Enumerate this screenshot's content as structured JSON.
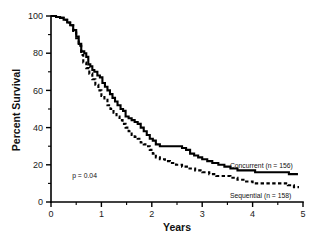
{
  "chart_data": {
    "type": "line",
    "title": "",
    "subtitle": "",
    "xlabel": "Years",
    "ylabel": "Percent Survival",
    "xlim": [
      0,
      5
    ],
    "ylim": [
      0,
      100
    ],
    "xticks": [
      0,
      1,
      2,
      3,
      4,
      5
    ],
    "xtick_labels": [
      "0",
      "1",
      "2",
      "3",
      "4",
      "5"
    ],
    "xminor_ticks": [
      0.5,
      1.5,
      2.5,
      3.5,
      4.5
    ],
    "yticks": [
      0,
      20,
      40,
      60,
      80,
      100
    ],
    "ytick_labels": [
      "0",
      "20",
      "40",
      "60",
      "80",
      "100"
    ],
    "yminor_ticks": [
      10,
      30,
      50,
      70,
      90
    ],
    "grid": false,
    "legend_position": "inline-right",
    "annotations": [
      {
        "name": "p-value",
        "text": "p = 0.04",
        "x": 0.42,
        "y": 13
      }
    ],
    "series": [
      {
        "name": "Concurrent",
        "label": "Concurrent (n = 156)",
        "n": 156,
        "style": "solid",
        "color": "#000000",
        "label_x": 3.55,
        "label_y": 20,
        "points": [
          [
            0.0,
            100
          ],
          [
            0.1,
            99.5
          ],
          [
            0.18,
            99
          ],
          [
            0.25,
            98
          ],
          [
            0.32,
            96.5
          ],
          [
            0.38,
            95
          ],
          [
            0.44,
            92.5
          ],
          [
            0.5,
            89
          ],
          [
            0.55,
            85
          ],
          [
            0.6,
            81
          ],
          [
            0.66,
            80
          ],
          [
            0.7,
            78
          ],
          [
            0.74,
            74
          ],
          [
            0.78,
            73
          ],
          [
            0.82,
            71
          ],
          [
            0.86,
            70
          ],
          [
            0.92,
            68
          ],
          [
            0.97,
            67
          ],
          [
            1.02,
            64
          ],
          [
            1.07,
            62
          ],
          [
            1.12,
            60
          ],
          [
            1.17,
            58
          ],
          [
            1.22,
            56
          ],
          [
            1.27,
            54
          ],
          [
            1.32,
            52
          ],
          [
            1.38,
            50
          ],
          [
            1.43,
            49
          ],
          [
            1.48,
            46
          ],
          [
            1.54,
            45
          ],
          [
            1.6,
            44
          ],
          [
            1.66,
            43
          ],
          [
            1.72,
            42
          ],
          [
            1.78,
            40
          ],
          [
            1.84,
            38
          ],
          [
            1.9,
            36
          ],
          [
            1.96,
            34
          ],
          [
            2.02,
            33
          ],
          [
            2.08,
            31
          ],
          [
            2.16,
            30
          ],
          [
            2.26,
            30
          ],
          [
            2.38,
            30
          ],
          [
            2.5,
            30
          ],
          [
            2.6,
            29
          ],
          [
            2.68,
            28
          ],
          [
            2.76,
            26
          ],
          [
            2.84,
            25
          ],
          [
            2.92,
            24
          ],
          [
            3.0,
            23
          ],
          [
            3.1,
            22
          ],
          [
            3.2,
            21
          ],
          [
            3.32,
            20
          ],
          [
            3.44,
            19
          ],
          [
            3.56,
            18
          ],
          [
            3.7,
            17
          ],
          [
            3.86,
            17
          ],
          [
            4.05,
            16
          ],
          [
            4.3,
            16
          ],
          [
            4.55,
            16
          ],
          [
            4.72,
            15
          ],
          [
            4.9,
            15
          ]
        ]
      },
      {
        "name": "Sequential",
        "label": "Sequential (n = 158)",
        "n": 158,
        "style": "dashed",
        "color": "#000000",
        "label_x": 3.55,
        "label_y": 4,
        "points": [
          [
            0.0,
            100
          ],
          [
            0.1,
            99.5
          ],
          [
            0.18,
            99
          ],
          [
            0.25,
            98
          ],
          [
            0.32,
            96.5
          ],
          [
            0.38,
            95
          ],
          [
            0.44,
            92
          ],
          [
            0.5,
            88
          ],
          [
            0.55,
            84
          ],
          [
            0.6,
            79
          ],
          [
            0.64,
            75
          ],
          [
            0.7,
            72
          ],
          [
            0.76,
            69
          ],
          [
            0.82,
            66
          ],
          [
            0.88,
            63
          ],
          [
            0.94,
            60
          ],
          [
            1.0,
            57
          ],
          [
            1.06,
            55
          ],
          [
            1.12,
            52
          ],
          [
            1.18,
            50
          ],
          [
            1.24,
            48
          ],
          [
            1.3,
            46
          ],
          [
            1.36,
            44
          ],
          [
            1.42,
            42
          ],
          [
            1.48,
            40
          ],
          [
            1.54,
            38
          ],
          [
            1.6,
            36
          ],
          [
            1.66,
            35
          ],
          [
            1.72,
            34
          ],
          [
            1.78,
            32
          ],
          [
            1.84,
            31
          ],
          [
            1.9,
            30
          ],
          [
            1.96,
            28
          ],
          [
            2.02,
            26
          ],
          [
            2.08,
            24
          ],
          [
            2.16,
            23
          ],
          [
            2.26,
            22
          ],
          [
            2.36,
            21
          ],
          [
            2.48,
            20
          ],
          [
            2.6,
            19
          ],
          [
            2.72,
            18
          ],
          [
            2.86,
            17
          ],
          [
            3.0,
            16
          ],
          [
            3.14,
            15
          ],
          [
            3.28,
            14
          ],
          [
            3.42,
            14
          ],
          [
            3.56,
            13
          ],
          [
            3.7,
            12
          ],
          [
            3.84,
            11
          ],
          [
            4.0,
            10
          ],
          [
            4.2,
            10
          ],
          [
            4.4,
            10
          ],
          [
            4.56,
            10
          ],
          [
            4.7,
            9
          ],
          [
            4.82,
            8
          ],
          [
            4.92,
            8
          ]
        ]
      }
    ]
  }
}
